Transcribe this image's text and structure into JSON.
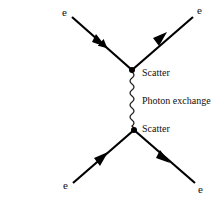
{
  "diagram": {
    "type": "feynman-diagram",
    "particles": {
      "top_left": "e",
      "top_right": "e",
      "bottom_left": "e",
      "bottom_right": "e"
    },
    "vertices": {
      "top": "Scatter",
      "bottom": "Scatter"
    },
    "propagator": "Photon exchange",
    "colors": {
      "line": "#000000",
      "text": "#111111",
      "background": "#ffffff"
    }
  }
}
